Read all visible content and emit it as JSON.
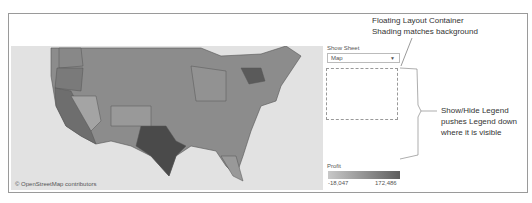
{
  "map": {
    "credit": "© OpenStreetMap contributors"
  },
  "parameter": {
    "label": "Show Sheet",
    "selected": "Map"
  },
  "legend": {
    "title": "Profit",
    "min": "-18,047",
    "max": "172,486",
    "color_low": "#c8c8c8",
    "color_high": "#5e5e5e"
  },
  "annotations": {
    "floating_line1": "Floating Layout Container",
    "floating_line2": "Shading matches background",
    "legend_line1": "Show/Hide Legend",
    "legend_line2": "pushes Legend down",
    "legend_line3": "where it is visible"
  }
}
